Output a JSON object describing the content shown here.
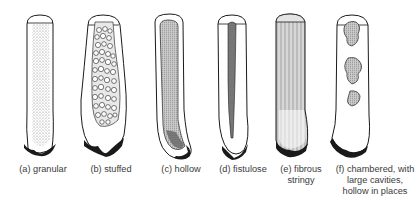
{
  "figure": {
    "panels": [
      {
        "id": "a",
        "label": "(a) granular",
        "lines": [
          "(a) granular"
        ]
      },
      {
        "id": "b",
        "label": "(b) stuffed",
        "lines": [
          "(b) stuffed"
        ]
      },
      {
        "id": "c",
        "label": "(c) hollow",
        "lines": [
          "(c) hollow"
        ]
      },
      {
        "id": "d",
        "label": "(d) fistulose",
        "lines": [
          "(d) fistulose"
        ]
      },
      {
        "id": "e",
        "label": "(e) fibrous stringy",
        "lines": [
          "(e) fibrous",
          "stringy"
        ]
      },
      {
        "id": "f",
        "label": "(f) chambered, with large cavities, hollow in places",
        "lines": [
          "(f) chambered, with",
          "large cavities,",
          "hollow in places"
        ]
      }
    ]
  },
  "colors": {
    "outline": "#1a1a1a",
    "stipple": "#8a8a8a",
    "background": "#ffffff",
    "caption": "#3a3a3a"
  }
}
